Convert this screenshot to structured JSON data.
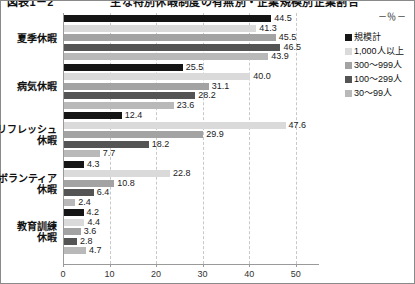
{
  "title": "図表1－2　　　　　主な特別休暇制度の有無別・企業規模別企業割合",
  "unit_label": "－％－",
  "legend": {
    "position": "right",
    "items": [
      {
        "label": "規模計",
        "color": "#151515"
      },
      {
        "label": "1,000人以上",
        "color": "#dadada"
      },
      {
        "label": "300～999人",
        "color": "#a3a3a3"
      },
      {
        "label": "100～299人",
        "color": "#545454"
      },
      {
        "label": "30～99人",
        "color": "#b9b9b9"
      }
    ]
  },
  "chart_data": {
    "type": "bar",
    "orientation": "horizontal",
    "title": "図表1－2　　　　　主な特別休暇制度の有無別・企業規模別企業割合",
    "xlabel": "",
    "ylabel": "",
    "unit": "％",
    "xlim": [
      0,
      55
    ],
    "xticks": [
      "0",
      "10",
      "20",
      "30",
      "40",
      "50"
    ],
    "xtick_values": [
      0,
      10,
      20,
      30,
      40,
      50
    ],
    "grid": "vertical-dashed",
    "legend_position": "right",
    "categories": [
      "夏季休暇",
      "病気休暇",
      "リフレッシュ\n休暇",
      "ボランティア\n休暇",
      "教育訓練\n休暇"
    ],
    "series": [
      {
        "name": "規模計",
        "color": "#151515",
        "values": [
          44.5,
          25.5,
          12.4,
          4.3,
          4.2
        ]
      },
      {
        "name": "1,000人以上",
        "color": "#dadada",
        "values": [
          41.3,
          40.0,
          47.6,
          22.8,
          4.4
        ]
      },
      {
        "name": "300～999人",
        "color": "#a3a3a3",
        "values": [
          45.5,
          31.1,
          29.9,
          10.8,
          3.6
        ]
      },
      {
        "name": "100～299人",
        "color": "#545454",
        "values": [
          46.5,
          28.2,
          18.2,
          6.4,
          2.8
        ]
      },
      {
        "name": "30～99人",
        "color": "#b9b9b9",
        "values": [
          43.9,
          23.6,
          7.7,
          2.4,
          4.7
        ]
      }
    ],
    "data_labels": [
      [
        "44.5",
        "41.3",
        "45.5",
        "46.5",
        "43.9"
      ],
      [
        "25.5",
        "40.0",
        "31.1",
        "28.2",
        "23.6"
      ],
      [
        "12.4",
        "47.6",
        "29.9",
        "18.2",
        "7.7"
      ],
      [
        "4.3",
        "22.8",
        "10.8",
        "6.4",
        "2.4"
      ],
      [
        "4.2",
        "4.4",
        "3.6",
        "2.8",
        "4.7"
      ]
    ]
  }
}
